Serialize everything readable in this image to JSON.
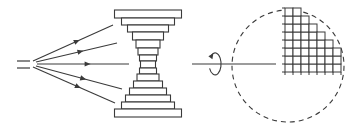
{
  "diagram": {
    "title": "",
    "stroke_color": "#3a3a3a",
    "background": "#ffffff",
    "source": {
      "name": "beam-source",
      "lines": [
        {
          "x1": 17,
          "y1": 61,
          "x2": 30,
          "y2": 61
        },
        {
          "x1": 17,
          "y1": 68,
          "x2": 30,
          "y2": 68
        }
      ]
    },
    "rays": [
      {
        "x1": 33,
        "y1": 61,
        "x2": 113,
        "y2": 25,
        "arrow_t": 0.55
      },
      {
        "x1": 36,
        "y1": 62,
        "x2": 117,
        "y2": 43,
        "arrow_t": 0.55
      },
      {
        "x1": 37,
        "y1": 64,
        "x2": 129,
        "y2": 64,
        "arrow_t": 0.55
      },
      {
        "x1": 36,
        "y1": 66,
        "x2": 122,
        "y2": 89,
        "arrow_t": 0.55
      },
      {
        "x1": 33,
        "y1": 67,
        "x2": 115,
        "y2": 103,
        "arrow_t": 0.55
      }
    ],
    "stack": {
      "name": "stepped-hourglass-lens",
      "center_x": 148,
      "layers": [
        {
          "y": 10,
          "h": 8,
          "w": 67
        },
        {
          "y": 18,
          "h": 7,
          "w": 53
        },
        {
          "y": 25,
          "h": 7,
          "w": 41
        },
        {
          "y": 32,
          "h": 8,
          "w": 31
        },
        {
          "y": 40,
          "h": 8,
          "w": 24
        },
        {
          "y": 48,
          "h": 7,
          "w": 20
        },
        {
          "y": 55,
          "h": 6,
          "w": 17
        },
        {
          "y": 61,
          "h": 7,
          "w": 15
        },
        {
          "y": 68,
          "h": 6,
          "w": 17
        },
        {
          "y": 74,
          "h": 7,
          "w": 22
        },
        {
          "y": 81,
          "h": 7,
          "w": 29
        },
        {
          "y": 88,
          "h": 7,
          "w": 37
        },
        {
          "y": 95,
          "h": 7,
          "w": 45
        },
        {
          "y": 102,
          "h": 7,
          "w": 53
        },
        {
          "y": 109,
          "h": 8,
          "w": 67
        }
      ]
    },
    "rotation": {
      "name": "rotation-arrow",
      "cx": 215,
      "cy": 64,
      "rx": 6,
      "ry": 11,
      "axis": {
        "x1": 192,
        "y1": 64,
        "x2": 276,
        "y2": 64
      }
    },
    "circle": {
      "name": "dashed-boundary-circle",
      "cx": 288,
      "cy": 66,
      "r": 56,
      "dash": "5,4"
    },
    "grid": {
      "name": "quadrant-pixel-grid",
      "x0": 285,
      "y_bottom": 72,
      "cell": 8,
      "columns_heights": [
        8,
        8,
        7,
        6,
        5,
        4,
        3
      ]
    }
  }
}
